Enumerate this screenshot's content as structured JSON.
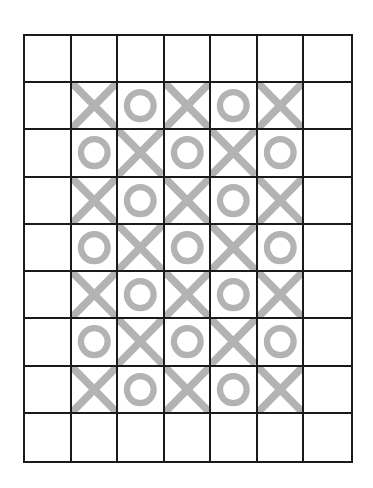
{
  "board": {
    "rows": 9,
    "cols": 7,
    "mark_color": "#b3b3b3",
    "line_color": "#1a1a1a",
    "cells": [
      [
        "",
        "",
        "",
        "",
        "",
        "",
        ""
      ],
      [
        "",
        "X",
        "O",
        "X",
        "O",
        "X",
        ""
      ],
      [
        "",
        "O",
        "X",
        "O",
        "X",
        "O",
        ""
      ],
      [
        "",
        "X",
        "O",
        "X",
        "O",
        "X",
        ""
      ],
      [
        "",
        "O",
        "X",
        "O",
        "X",
        "O",
        ""
      ],
      [
        "",
        "X",
        "O",
        "X",
        "O",
        "X",
        ""
      ],
      [
        "",
        "O",
        "X",
        "O",
        "X",
        "O",
        ""
      ],
      [
        "",
        "X",
        "O",
        "X",
        "O",
        "X",
        ""
      ],
      [
        "",
        "",
        "",
        "",
        "",
        "",
        ""
      ]
    ]
  }
}
